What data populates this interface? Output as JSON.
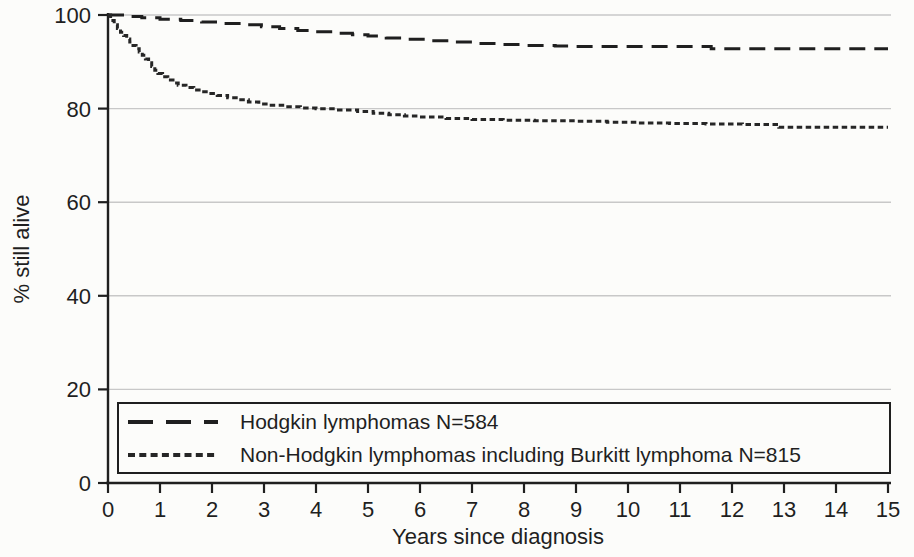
{
  "chart_data": {
    "type": "line",
    "subtype": "kaplan-meier-survival-step",
    "title": "",
    "xlabel": "Years since diagnosis",
    "ylabel": "% still alive",
    "xlim": [
      0,
      15
    ],
    "ylim": [
      0,
      100
    ],
    "x_ticks": [
      0,
      1,
      2,
      3,
      4,
      5,
      6,
      7,
      8,
      9,
      10,
      11,
      12,
      13,
      14,
      15
    ],
    "y_ticks": [
      0,
      20,
      40,
      60,
      80,
      100
    ],
    "grid": "horizontal-light-gray",
    "legend_position": "bottom-left-boxed",
    "series": [
      {
        "id": "hodgkin",
        "name": "Hodgkin lymphomas N=584",
        "n": 584,
        "line_style": "long-dash",
        "color": "#1f1f1f",
        "points": [
          [
            0,
            100
          ],
          [
            0.35,
            99.7
          ],
          [
            0.65,
            99.4
          ],
          [
            1,
            99.1
          ],
          [
            1.4,
            98.8
          ],
          [
            1.8,
            98.5
          ],
          [
            2.2,
            98.2
          ],
          [
            2.6,
            97.9
          ],
          [
            2.95,
            97.5
          ],
          [
            3.3,
            97.1
          ],
          [
            3.65,
            96.7
          ],
          [
            4,
            96.4
          ],
          [
            4.35,
            96.1
          ],
          [
            4.7,
            95.8
          ],
          [
            5,
            95.5
          ],
          [
            5.35,
            95.1
          ],
          [
            5.7,
            94.8
          ],
          [
            6.1,
            94.5
          ],
          [
            6.55,
            94.2
          ],
          [
            7,
            93.9
          ],
          [
            7.5,
            93.7
          ],
          [
            8,
            93.5
          ],
          [
            8.6,
            93.4
          ],
          [
            9,
            93.3
          ],
          [
            11.6,
            92.8
          ],
          [
            15,
            92.8
          ]
        ]
      },
      {
        "id": "non-hodgkin",
        "name": "Non-Hodgkin lymphomas including Burkitt lymphoma N=815",
        "n": 815,
        "line_style": "short-dash",
        "color": "#262626",
        "points": [
          [
            0,
            100
          ],
          [
            0.05,
            98.8
          ],
          [
            0.12,
            97.9
          ],
          [
            0.18,
            97.1
          ],
          [
            0.24,
            96.3
          ],
          [
            0.3,
            95.6
          ],
          [
            0.36,
            94.9
          ],
          [
            0.42,
            94.2
          ],
          [
            0.48,
            93.5
          ],
          [
            0.54,
            92.8
          ],
          [
            0.6,
            92.1
          ],
          [
            0.66,
            91.4
          ],
          [
            0.72,
            90.6
          ],
          [
            0.78,
            89.8
          ],
          [
            0.84,
            89
          ],
          [
            0.9,
            88.2
          ],
          [
            0.96,
            87.5
          ],
          [
            1.05,
            86.8
          ],
          [
            1.15,
            86.1
          ],
          [
            1.25,
            85.5
          ],
          [
            1.35,
            85
          ],
          [
            1.5,
            84.5
          ],
          [
            1.65,
            84
          ],
          [
            1.8,
            83.6
          ],
          [
            1.95,
            83.2
          ],
          [
            2.1,
            82.8
          ],
          [
            2.3,
            82.3
          ],
          [
            2.5,
            81.9
          ],
          [
            2.7,
            81.4
          ],
          [
            2.9,
            81
          ],
          [
            3.1,
            80.7
          ],
          [
            3.4,
            80.4
          ],
          [
            3.7,
            80.15
          ],
          [
            4,
            79.95
          ],
          [
            4.4,
            79.7
          ],
          [
            4.8,
            79.4
          ],
          [
            5.1,
            79
          ],
          [
            5.4,
            78.7
          ],
          [
            5.7,
            78.4
          ],
          [
            6,
            78.2
          ],
          [
            6.5,
            77.9
          ],
          [
            7,
            77.7
          ],
          [
            7.6,
            77.5
          ],
          [
            8.2,
            77.4
          ],
          [
            9,
            77.3
          ],
          [
            9.6,
            77.1
          ],
          [
            10.2,
            76.9
          ],
          [
            10.8,
            76.8
          ],
          [
            11.5,
            76.7
          ],
          [
            12.2,
            76.6
          ],
          [
            12.9,
            76
          ],
          [
            15,
            76
          ]
        ]
      }
    ]
  },
  "colors": {
    "background": "#fcfcfa",
    "axis": "#1f1f1f",
    "gridline": "#c8c8c8",
    "legend_border": "#1f1f1f",
    "text": "#1f1f1f"
  }
}
